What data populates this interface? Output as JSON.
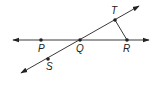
{
  "diagram": {
    "type": "geometry",
    "colors": {
      "line": "#3a3a3a",
      "point": "#222222",
      "label": "#222222",
      "background": "#ffffff"
    },
    "points": [
      {
        "id": "P",
        "label": "P",
        "x": 41,
        "y": 40
      },
      {
        "id": "Q",
        "label": "Q",
        "x": 80,
        "y": 40
      },
      {
        "id": "R",
        "label": "R",
        "x": 127,
        "y": 40
      },
      {
        "id": "T",
        "label": "T",
        "x": 115,
        "y": 20
      },
      {
        "id": "S",
        "label": "S",
        "x": 48,
        "y": 59
      }
    ],
    "lines": [
      {
        "name": "line PR",
        "through": [
          "P",
          "Q",
          "R"
        ],
        "arrows": "both"
      },
      {
        "name": "line ST",
        "through": [
          "S",
          "Q",
          "T"
        ],
        "arrows": "both"
      }
    ],
    "segments": [
      {
        "name": "segment TR",
        "from": "T",
        "to": "R"
      }
    ]
  }
}
